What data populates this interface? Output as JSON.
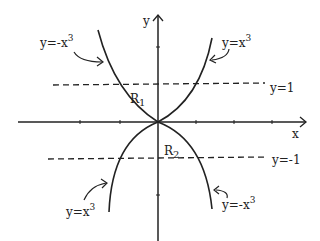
{
  "diagram": {
    "type": "graph-of-curves",
    "axes": {
      "x_label": "x",
      "y_label": "y"
    },
    "reference_lines": [
      {
        "label": "y=1",
        "value": 1,
        "style": "dashed"
      },
      {
        "label": "y=-1",
        "value": -1,
        "style": "dashed"
      }
    ],
    "curves": [
      {
        "label_base": "y=-x",
        "exp": "3",
        "position": "upper-left"
      },
      {
        "label_base": "y=x",
        "exp": "3",
        "position": "upper-right"
      },
      {
        "label_base": "y=x",
        "exp": "3",
        "position": "lower-left"
      },
      {
        "label_base": "y=-x",
        "exp": "3",
        "position": "lower-right"
      }
    ],
    "regions": [
      {
        "label": "R",
        "sub": "1"
      },
      {
        "label": "R",
        "sub": "2"
      }
    ],
    "colors": {
      "ink": "#222222",
      "background": "#ffffff"
    }
  }
}
